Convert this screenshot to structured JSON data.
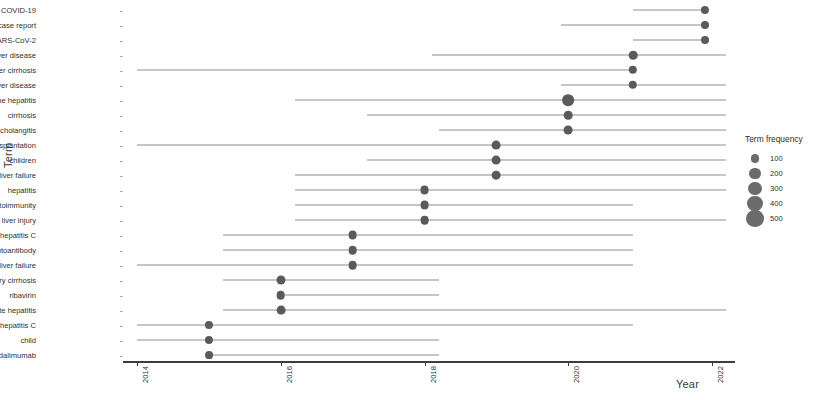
{
  "chart_data": {
    "type": "scatter",
    "title": "",
    "xlabel": "Year",
    "ylabel": "Term",
    "xlim": [
      2013.6,
      2022.4
    ],
    "grid": false,
    "legend": {
      "position": "right",
      "title": "Term frequency",
      "entries": [
        {
          "label": "100",
          "size": 4.4
        },
        {
          "label": "200",
          "size": 5.6
        },
        {
          "label": "300",
          "size": 6.6
        },
        {
          "label": "400",
          "size": 7.6
        },
        {
          "label": "500",
          "size": 8.6
        }
      ]
    },
    "xticks": [
      2014,
      2016,
      2018,
      2020,
      2022
    ],
    "xtick_labels": [
      "2014",
      "2016",
      "2018",
      "2020",
      "2022"
    ],
    "categories": [
      "COVID-19",
      "case report",
      "SARS-CoV-2",
      "autoimmune liver disease",
      "liver cirrhosis",
      "liver disease",
      "autoimmune hepatitis",
      "cirrhosis",
      "primary biliary cholangitis",
      "liver transplantation",
      "children",
      "acute liver failure",
      "hepatitis",
      "autoimmunity",
      "drug-induced liver injury",
      "hepatitis C",
      "autoantibody",
      "liver failure",
      "primary biliary cirrhosis",
      "ribavirin",
      "acute hepatitis",
      "chronic hepatitis C",
      "child",
      "adalimumab"
    ],
    "points": [
      {
        "term": "COVID-19",
        "year": 2021.9,
        "frequency": 150,
        "range_start": 2020.9,
        "range_end": 2021.9
      },
      {
        "term": "case report",
        "year": 2021.9,
        "frequency": 140,
        "range_start": 2019.9,
        "range_end": 2021.9
      },
      {
        "term": "SARS-CoV-2",
        "year": 2021.9,
        "frequency": 135,
        "range_start": 2020.9,
        "range_end": 2021.9
      },
      {
        "term": "autoimmune liver disease",
        "year": 2020.9,
        "frequency": 185,
        "range_start": 2018.1,
        "range_end": 2022.2
      },
      {
        "term": "liver cirrhosis",
        "year": 2020.9,
        "frequency": 170,
        "range_start": 2014.0,
        "range_end": 2020.9
      },
      {
        "term": "liver disease",
        "year": 2020.9,
        "frequency": 175,
        "range_start": 2019.9,
        "range_end": 2022.2
      },
      {
        "term": "autoimmune hepatitis",
        "year": 2020.0,
        "frequency": 520,
        "range_start": 2016.2,
        "range_end": 2022.2
      },
      {
        "term": "cirrhosis",
        "year": 2020.0,
        "frequency": 185,
        "range_start": 2017.2,
        "range_end": 2022.2
      },
      {
        "term": "primary biliary cholangitis",
        "year": 2020.0,
        "frequency": 205,
        "range_start": 2018.2,
        "range_end": 2022.2
      },
      {
        "term": "liver transplantation",
        "year": 2019.0,
        "frequency": 200,
        "range_start": 2014.0,
        "range_end": 2022.2
      },
      {
        "term": "children",
        "year": 2019.0,
        "frequency": 200,
        "range_start": 2017.2,
        "range_end": 2022.2
      },
      {
        "term": "acute liver failure",
        "year": 2019.0,
        "frequency": 195,
        "range_start": 2016.2,
        "range_end": 2022.2
      },
      {
        "term": "hepatitis",
        "year": 2018.0,
        "frequency": 215,
        "range_start": 2016.2,
        "range_end": 2022.2
      },
      {
        "term": "autoimmunity",
        "year": 2018.0,
        "frequency": 200,
        "range_start": 2016.2,
        "range_end": 2020.9
      },
      {
        "term": "drug-induced liver injury",
        "year": 2018.0,
        "frequency": 195,
        "range_start": 2016.2,
        "range_end": 2022.2
      },
      {
        "term": "hepatitis C",
        "year": 2017.0,
        "frequency": 200,
        "range_start": 2015.2,
        "range_end": 2020.9
      },
      {
        "term": "autoantibody",
        "year": 2017.0,
        "frequency": 195,
        "range_start": 2015.2,
        "range_end": 2020.9
      },
      {
        "term": "liver failure",
        "year": 2017.0,
        "frequency": 195,
        "range_start": 2014.0,
        "range_end": 2020.9
      },
      {
        "term": "primary biliary cirrhosis",
        "year": 2016.0,
        "frequency": 220,
        "range_start": 2015.2,
        "range_end": 2018.2
      },
      {
        "term": "ribavirin",
        "year": 2016.0,
        "frequency": 195,
        "range_start": 2016.0,
        "range_end": 2018.2
      },
      {
        "term": "acute hepatitis",
        "year": 2016.0,
        "frequency": 200,
        "range_start": 2015.2,
        "range_end": 2022.2
      },
      {
        "term": "chronic hepatitis C",
        "year": 2015.0,
        "frequency": 145,
        "range_start": 2014.0,
        "range_end": 2020.9
      },
      {
        "term": "child",
        "year": 2015.0,
        "frequency": 145,
        "range_start": 2014.0,
        "range_end": 2018.2
      },
      {
        "term": "adalimumab",
        "year": 2015.0,
        "frequency": 130,
        "range_start": 2015.0,
        "range_end": 2018.2
      }
    ]
  }
}
